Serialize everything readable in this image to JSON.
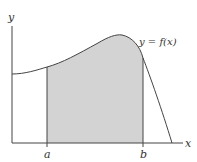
{
  "diagram": {
    "labels": {
      "y_axis": "y",
      "x_axis": "x",
      "curve": "y = f(x)",
      "a": "a",
      "b": "b"
    },
    "colors": {
      "shade": "#d3d3d3",
      "line": "#444444",
      "background": "#ffffff"
    },
    "shaded_region": {
      "from": "a",
      "to": "b",
      "under": "y = f(x)"
    }
  }
}
